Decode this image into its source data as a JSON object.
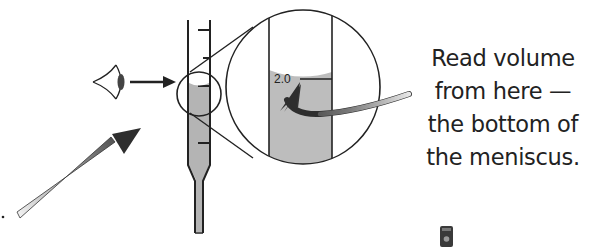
{
  "diagram": {
    "magnified_label": "2.0",
    "caption_lines": [
      "Read volume",
      "from here —",
      "the bottom of",
      "the meniscus."
    ],
    "elements": {
      "eye": "eye-icon",
      "sight_arrow": "arrow-right-icon",
      "pointer_arrow": "gradient-arrow-icon",
      "burette": "burette",
      "zoom_circle": "magnifier-circle",
      "curved_arrow": "curved-arrow-icon"
    },
    "colors": {
      "line": "#222222",
      "liquid": "#b4b4b4",
      "liquid_magnified": "#bdbdbd",
      "arrow_dark": "#3a3a3a",
      "arrow_light": "#e6e6e6",
      "background": "#ffffff"
    }
  }
}
